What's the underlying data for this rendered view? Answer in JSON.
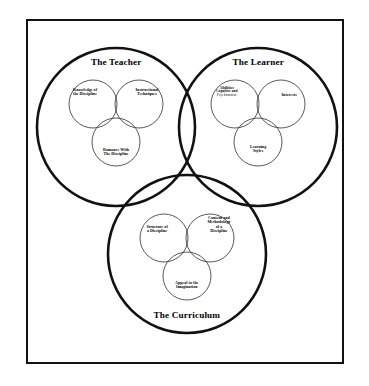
{
  "diagram": {
    "type": "venn",
    "title_visible": false,
    "frame": {
      "present": true,
      "color": "#111111"
    },
    "colors": {
      "outline": "#111111",
      "inner_outline": "#222222",
      "background": "#ffffff",
      "text": "#000000"
    },
    "major_circles": [
      {
        "id": "teacher",
        "label": "The Teacher",
        "cx": 116,
        "cy": 127,
        "r": 79,
        "label_x": 116,
        "label_y": 62,
        "inner_venn": {
          "r": 24,
          "circles": [
            {
              "id": "knowledge-of-the-discipline",
              "label": "Knowledge of\nthe Discipline",
              "cx": 93,
              "cy": 104,
              "label_x": 85,
              "label_y": 92
            },
            {
              "id": "instructional-techniques",
              "label": "Instructional\nTechniques",
              "cx": 139,
              "cy": 104,
              "label_x": 147,
              "label_y": 92
            },
            {
              "id": "romance-with-the-discipline",
              "label": "Romance With\nThe Discipline",
              "cx": 116,
              "cy": 142,
              "label_x": 116,
              "label_y": 152
            }
          ]
        }
      },
      {
        "id": "learner",
        "label": "The Learner",
        "cx": 258,
        "cy": 127,
        "r": 79,
        "label_x": 258,
        "label_y": 62,
        "inner_venn": {
          "r": 24,
          "circles": [
            {
              "id": "abilities",
              "label": "Abilities",
              "sub_label_1": "Cognitive and",
              "sub_label_2": "Psychomotor",
              "cx": 235,
              "cy": 104,
              "label_x": 227,
              "label_y": 92
            },
            {
              "id": "interests",
              "label": "Interests",
              "cx": 281,
              "cy": 104,
              "label_x": 289,
              "label_y": 95
            },
            {
              "id": "learning-styles",
              "label": "Learning\nStyles",
              "cx": 258,
              "cy": 142,
              "label_x": 258,
              "label_y": 149
            }
          ]
        }
      },
      {
        "id": "curriculum",
        "label": "The Curriculum",
        "cx": 187,
        "cy": 254,
        "r": 79,
        "label_x": 187,
        "label_y": 315,
        "inner_venn": {
          "r": 24,
          "circles": [
            {
              "id": "structure-of-a-discipline",
              "label": "Structure of\na Discipline",
              "cx": 164,
              "cy": 238,
              "label_x": 157,
              "label_y": 229
            },
            {
              "id": "content-and-methodology-of-a-discipline",
              "label": "Content and\nMethodology\nof a\nDiscipline",
              "cx": 210,
              "cy": 238,
              "label_x": 219,
              "label_y": 225
            },
            {
              "id": "appeal-to-the-imagination",
              "label": "Appeal to the\nImagination",
              "cx": 187,
              "cy": 276,
              "label_x": 187,
              "label_y": 285
            }
          ]
        }
      }
    ]
  }
}
